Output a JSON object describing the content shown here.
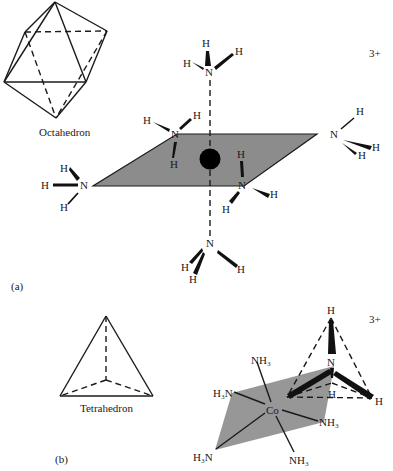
{
  "figure": {
    "part_a": {
      "label": "(a)",
      "polyhedron_caption": "Octahedron",
      "charge": "3+",
      "central_atom": "metal",
      "ligands": [
        {
          "position": "top",
          "atom": "N",
          "hydrogens": [
            "H",
            "H",
            "H"
          ]
        },
        {
          "position": "back-left",
          "atom": "N",
          "hydrogens": [
            "H",
            "H",
            "H"
          ]
        },
        {
          "position": "left",
          "atom": "N",
          "hydrogens": [
            "H",
            "H",
            "H"
          ]
        },
        {
          "position": "right",
          "atom": "N",
          "hydrogens": [
            "H",
            "H",
            "H"
          ]
        },
        {
          "position": "front-right",
          "atom": "N",
          "hydrogens": [
            "H",
            "H",
            "H"
          ]
        },
        {
          "position": "bottom",
          "atom": "N",
          "hydrogens": [
            "H",
            "H",
            "H"
          ]
        }
      ]
    },
    "part_b": {
      "label": "(b)",
      "polyhedron_caption": "Tetrahedron",
      "charge": "3+",
      "central_atom": "Co",
      "ligand_labels": {
        "top": "NH₃",
        "upper_left": "H₃N",
        "lower_left": "H₃N",
        "right": "NH₃",
        "bottom": "NH₃"
      },
      "tetrahedral_ligand": {
        "atom": "N",
        "hydrogens": [
          "H",
          "H",
          "H",
          "H"
        ]
      }
    },
    "colors": {
      "plane_fill": "#8c8c8c",
      "line": "#1a1a1a",
      "metal": "#000000",
      "background": "#ffffff"
    }
  }
}
